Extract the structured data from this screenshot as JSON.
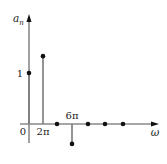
{
  "chart_data": {
    "type": "stem",
    "title": "",
    "xlabel": "ω",
    "ylabel": "a_n",
    "ylabel_main": "a",
    "ylabel_sub": "n",
    "x_tick_labels": [
      "0",
      "2π",
      "6π"
    ],
    "y_tick_labels": [
      "1"
    ],
    "x": [
      "0",
      "2π",
      "4π",
      "6π",
      "8π",
      "10π",
      "12π"
    ],
    "values": [
      1,
      1.33,
      0,
      -0.39,
      0,
      0,
      0
    ],
    "grid": false,
    "legend": null
  },
  "figure": {
    "axis_color": "#8a8a8a",
    "stem_color": "#7a7a7a",
    "marker_color": "#111111",
    "origin_px": [
      29,
      124
    ],
    "unit_px": 51,
    "x_px": [
      29,
      43,
      57,
      72,
      88,
      105,
      123
    ],
    "labels": {
      "origin": "0",
      "tick_2pi": "2π",
      "tick_6pi": "6π",
      "tick_1": "1",
      "omega": "ω"
    }
  }
}
